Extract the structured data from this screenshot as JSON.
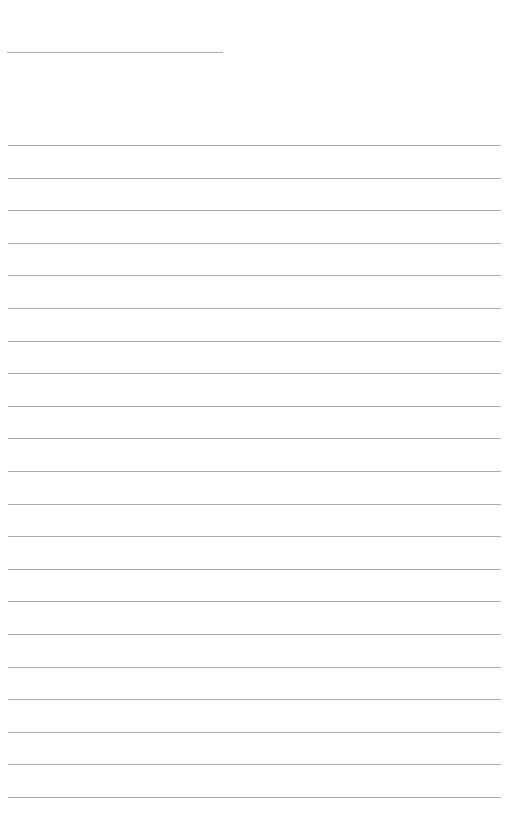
{
  "page": {
    "type": "lined-paper",
    "background_color": "#ffffff",
    "line_color": "#aaaaaa",
    "header_line": {
      "x": 7,
      "y": 52,
      "width": 216
    },
    "ruled_lines": {
      "count": 21,
      "first_y": 145,
      "spacing": 32.6,
      "x_start": 8,
      "x_end": 501
    },
    "text_content": []
  }
}
